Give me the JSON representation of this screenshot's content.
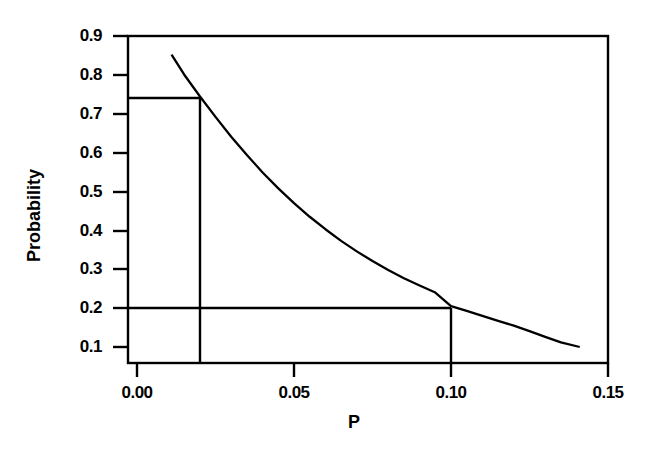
{
  "chart_data": {
    "type": "line",
    "title": "",
    "xlabel": "P",
    "ylabel": "Probability",
    "xlim": [
      0.0,
      0.15
    ],
    "ylim": [
      0.05,
      0.9
    ],
    "grid": false,
    "legend": null,
    "xticks": [
      "0.00",
      "0.05",
      "0.10",
      "0.15"
    ],
    "xtick_values": [
      0.0,
      0.05,
      0.1,
      0.15
    ],
    "yticks": [
      "0.9",
      "0.8",
      "0.7",
      "0.6",
      "0.5",
      "0.4",
      "0.3",
      "0.2",
      "0.1"
    ],
    "ytick_values": [
      0.9,
      0.8,
      0.7,
      0.6,
      0.5,
      0.4,
      0.3,
      0.2,
      0.1
    ],
    "series": [
      {
        "name": "Probability curve",
        "x": [
          0.011,
          0.015,
          0.02,
          0.025,
          0.03,
          0.035,
          0.04,
          0.045,
          0.05,
          0.055,
          0.06,
          0.065,
          0.07,
          0.075,
          0.08,
          0.085,
          0.09,
          0.095,
          0.1,
          0.105,
          0.11,
          0.115,
          0.12,
          0.125,
          0.13,
          0.135,
          0.141
        ],
        "y": [
          0.852,
          0.801,
          0.745,
          0.692,
          0.641,
          0.594,
          0.549,
          0.508,
          0.47,
          0.435,
          0.403,
          0.373,
          0.346,
          0.321,
          0.298,
          0.277,
          0.258,
          0.24,
          0.205,
          0.193,
          0.18,
          0.167,
          0.155,
          0.141,
          0.126,
          0.112,
          0.1
        ]
      }
    ],
    "reference_lines": [
      {
        "name": "upper-reference",
        "y_value": 0.745,
        "x_value": 0.02,
        "description": "horizontal line at Probability 0.745 from y-axis to curve, vertical drop at P = 0.02"
      },
      {
        "name": "lower-reference",
        "y_value": 0.205,
        "x_value": 0.1,
        "description": "horizontal line at Probability 0.205 from y-axis to curve, vertical drop at P = 0.10"
      }
    ]
  },
  "axis_titles": {
    "x": "P",
    "y": "Probability"
  },
  "tick_labels": {
    "y": [
      "0.9",
      "0.8",
      "0.7",
      "0.6",
      "0.5",
      "0.4",
      "0.3",
      "0.2",
      "0.1"
    ],
    "x": [
      "0.00",
      "0.05",
      "0.10",
      "0.15"
    ]
  },
  "colors": {
    "line": "#000000",
    "axis": "#000000",
    "background": "#ffffff"
  }
}
